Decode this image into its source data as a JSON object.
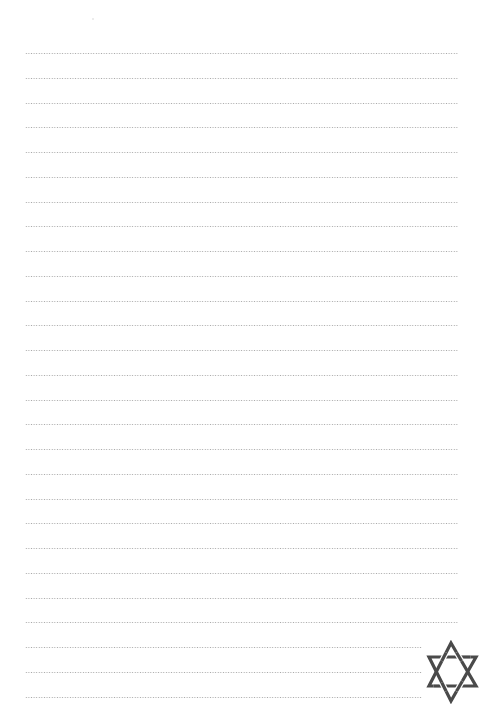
{
  "page": {
    "type": "lined-writing-paper",
    "background_color": "#ffffff",
    "rule_color": "#a8a8a8",
    "rule_style": "dotted",
    "rule_count": 27,
    "rule_first_y": 53,
    "rule_spacing": 24.75,
    "rule_left_x": 25,
    "rule_full_right_x": 458,
    "rule_short_right_x": 422,
    "short_rule_count": 3
  },
  "emblem": {
    "icon": "star-of-david-icon",
    "color": "#4a4a4a",
    "position": "bottom-right"
  }
}
